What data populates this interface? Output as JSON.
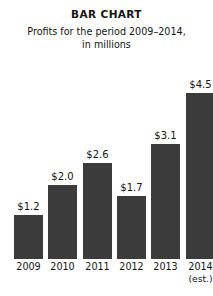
{
  "chart_data": {
    "type": "bar",
    "title": "BAR CHART",
    "subtitle": "Profits for the period 2009–2014,\nin millions",
    "subtitle_line1": "Profits for the period 2009–2014,",
    "subtitle_line2": "in millions",
    "categories": [
      "2009",
      "2010",
      "2011",
      "2012",
      "2013",
      "2014"
    ],
    "values": [
      1.2,
      2.0,
      2.6,
      1.7,
      3.1,
      4.5
    ],
    "value_labels": [
      "$1.2",
      "$2.0",
      "$2.6",
      "$1.7",
      "$3.1",
      "$4.5"
    ],
    "category_notes": [
      "",
      "",
      "",
      "",
      "",
      "(est.)"
    ],
    "xlabel": "",
    "ylabel": "",
    "ylim": [
      0,
      4.9
    ],
    "grid": false,
    "legend": false,
    "bar_color": "#3b3b3b",
    "background_color": "#ffffff",
    "text_color": "#141414",
    "units": "millions of dollars"
  }
}
